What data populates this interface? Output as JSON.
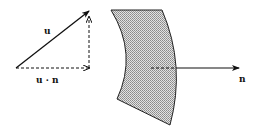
{
  "diagram": {
    "labels": {
      "u": "u",
      "projection": "u · n",
      "normal": "n"
    },
    "colors": {
      "stroke": "#111111",
      "fill": "#bdbdbd",
      "background": "#ffffff"
    }
  }
}
